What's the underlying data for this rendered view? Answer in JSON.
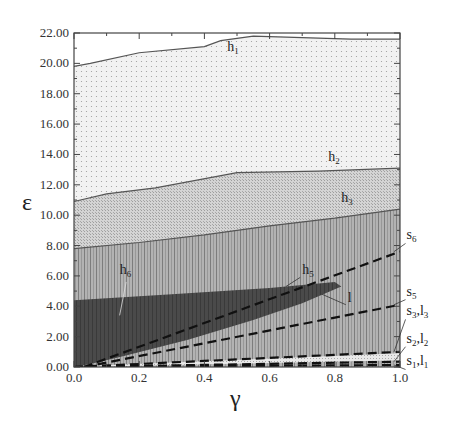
{
  "chart_data": {
    "type": "area",
    "title": "",
    "xlabel": "γ",
    "ylabel": "ε",
    "xlim": [
      0.0,
      1.0
    ],
    "ylim": [
      0.0,
      22.0
    ],
    "x_ticks": [
      "0.0",
      "0.2",
      "0.4",
      "0.6",
      "0.8",
      "1.0"
    ],
    "y_ticks": [
      "0.00",
      "2.00",
      "4.00",
      "6.00",
      "8.00",
      "10.00",
      "12.00",
      "14.00",
      "16.00",
      "18.00",
      "20.00",
      "22.00"
    ],
    "grid": false,
    "legend": null,
    "regions": [
      {
        "name": "h1",
        "label": "h",
        "sub": "1",
        "fill": "dots-light",
        "upper_boundary": {
          "x": [
            0.0,
            0.05,
            0.2,
            0.4,
            0.45,
            0.55,
            0.7,
            0.85,
            1.0
          ],
          "y": [
            19.8,
            20.0,
            20.7,
            21.1,
            21.5,
            21.8,
            21.7,
            21.6,
            21.6
          ]
        },
        "label_pos": [
          0.47,
          20.8
        ]
      },
      {
        "name": "h2",
        "label": "h",
        "sub": "2",
        "fill": "crosshatch-light",
        "upper_boundary": {
          "x": [
            0.0,
            0.1,
            0.25,
            0.5,
            0.75,
            1.0
          ],
          "y": [
            10.9,
            11.4,
            11.8,
            12.8,
            12.9,
            13.1
          ]
        },
        "label_pos": [
          0.78,
          13.6
        ]
      },
      {
        "name": "h3",
        "label": "h",
        "sub": "3",
        "fill": "vertical-lines",
        "upper_boundary": {
          "x": [
            0.0,
            0.2,
            0.4,
            0.6,
            0.8,
            1.0
          ],
          "y": [
            7.8,
            8.2,
            8.7,
            9.3,
            9.8,
            10.4
          ]
        },
        "label_pos": [
          0.82,
          10.9
        ]
      },
      {
        "name": "h6",
        "label": "h",
        "sub": "6",
        "fill": "dark",
        "polygon": {
          "x": [
            0.0,
            0.3,
            0.6,
            0.8,
            0.82,
            0.7,
            0.55,
            0.35,
            0.15,
            0.05,
            0.0
          ],
          "y": [
            4.4,
            4.8,
            5.2,
            5.6,
            5.3,
            4.2,
            3.1,
            1.8,
            0.7,
            0.2,
            0.0
          ]
        },
        "label_pos": [
          0.14,
          6.1
        ]
      }
    ],
    "series": [
      {
        "name": "s6",
        "label": "s",
        "sub": "6",
        "style": "dashed",
        "x": [
          0.03,
          1.0
        ],
        "y": [
          0.0,
          7.6
        ],
        "label_pos": [
          1.02,
          8.4
        ]
      },
      {
        "name": "s5",
        "label": "s",
        "sub": "5",
        "style": "dashed",
        "x": [
          0.03,
          1.0
        ],
        "y": [
          0.0,
          4.1
        ],
        "label_pos": [
          1.02,
          4.7
        ]
      },
      {
        "name": "s3,l3",
        "label": "s",
        "sub": "3",
        "label2": "l",
        "sub2": "3",
        "style": "dashed",
        "x": [
          0.0,
          1.0
        ],
        "y": [
          0.0,
          1.0
        ],
        "label_pos": [
          1.02,
          3.4
        ]
      },
      {
        "name": "s2,l2",
        "label": "s",
        "sub": "2",
        "label2": "l",
        "sub2": "2",
        "style": "dashed",
        "x": [
          0.0,
          1.0
        ],
        "y": [
          0.0,
          0.35
        ],
        "label_pos": [
          1.02,
          1.6
        ]
      },
      {
        "name": "s1,l1",
        "label": "s",
        "sub": "1",
        "label2": "l",
        "sub2": "1",
        "style": "dashed",
        "x": [
          0.0,
          1.0
        ],
        "y": [
          0.0,
          0.13
        ],
        "label_pos": [
          1.02,
          0.1
        ]
      }
    ],
    "annotations": [
      {
        "text": "h5",
        "label": "h",
        "sub": "5",
        "pos": [
          0.7,
          6.1
        ],
        "arrow_to": [
          0.65,
          5.3
        ]
      },
      {
        "text": "l",
        "label": "l",
        "sub": "",
        "pos": [
          0.84,
          4.3
        ],
        "arrow_to": [
          0.76,
          4.8
        ]
      }
    ]
  }
}
